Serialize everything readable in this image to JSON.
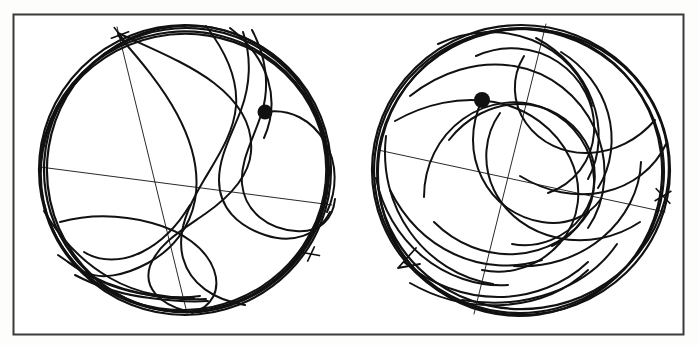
{
  "figure": {
    "kind": "scanned-scientific-figure",
    "title": "",
    "caption": "",
    "background_color": "#fdfdfc",
    "ink_color": "#111111",
    "frame": {
      "name": "outer-frame",
      "x": 13,
      "y": 14,
      "width": 670,
      "height": 320,
      "stroke": "#3a3a3a",
      "stroke_width": 2,
      "fill": "#ffffff"
    }
  },
  "panels": [
    {
      "id": "left-panel",
      "label": "",
      "boundary_circle": {
        "cx": 185,
        "cy": 170,
        "r": 146,
        "stroke_width": 2.2
      },
      "marker_dot": {
        "name": "marker-dot-left",
        "cx": 265,
        "cy": 112,
        "r": 7.5,
        "fill": "#111111"
      },
      "cross_marks": [
        {
          "name": "cross-mark-top-left",
          "x": 120,
          "y": 35,
          "size": 9,
          "rotation": 20
        },
        {
          "name": "cross-mark-bottom-right",
          "x": 311,
          "y": 254,
          "size": 8,
          "rotation": -25
        }
      ],
      "chord_lines": [
        {
          "name": "chord-diagonal-long",
          "x1": 40,
          "y1": 167,
          "x2": 332,
          "y2": 205
        },
        {
          "name": "chord-near-vertical",
          "x1": 117,
          "y1": 27,
          "x2": 187,
          "y2": 313
        }
      ],
      "trajectory_count": 11,
      "description": "sparse quasi-periodic trajectory confined near boundary"
    },
    {
      "id": "right-panel",
      "label": "",
      "boundary_circle": {
        "cx": 521,
        "cy": 170,
        "r": 149,
        "stroke_width": 2.2
      },
      "marker_dot": {
        "name": "marker-dot-right",
        "cx": 482,
        "cy": 100,
        "r": 8.0,
        "fill": "#111111"
      },
      "cross_marks": [
        {
          "name": "cross-mark-right-edge",
          "x": 663,
          "y": 196,
          "size": 9,
          "rotation": 10
        }
      ],
      "arrow_marks": [
        {
          "name": "arrow-head-lower-left",
          "x": 404,
          "y": 262,
          "angle": 230,
          "size": 11
        }
      ],
      "chord_lines": [
        {
          "name": "chord-diagonal-long",
          "x1": 378,
          "y1": 150,
          "x2": 665,
          "y2": 212
        },
        {
          "name": "chord-near-vertical",
          "x1": 546,
          "y1": 24,
          "x2": 474,
          "y2": 314
        }
      ],
      "trajectory_count": 18,
      "description": "dense ergodic-looking trajectory filling the disc"
    }
  ],
  "legend": {
    "visible": false,
    "entries": []
  },
  "axes": {
    "visible": false,
    "tick_labels": []
  },
  "chart_data": {
    "type": "line",
    "title": "",
    "xlabel": "",
    "ylabel": "",
    "grid": false,
    "legend_position": "none",
    "xlim": [
      -1,
      1
    ],
    "ylim": [
      -1,
      1
    ],
    "panels": [
      {
        "name": "left-panel",
        "series": [
          {
            "name": "boundary-circle",
            "kind": "circle",
            "cx": 0,
            "cy": 0,
            "r": 1
          },
          {
            "name": "trajectory",
            "kind": "path",
            "point_count": 0
          },
          {
            "name": "marker",
            "kind": "point",
            "x": 0.548,
            "y": 0.397
          }
        ]
      },
      {
        "name": "right-panel",
        "series": [
          {
            "name": "boundary-circle",
            "kind": "circle",
            "cx": 0,
            "cy": 0,
            "r": 1
          },
          {
            "name": "trajectory",
            "kind": "path",
            "point_count": 0
          },
          {
            "name": "marker",
            "kind": "point",
            "x": -0.262,
            "y": 0.47
          }
        ]
      }
    ]
  }
}
